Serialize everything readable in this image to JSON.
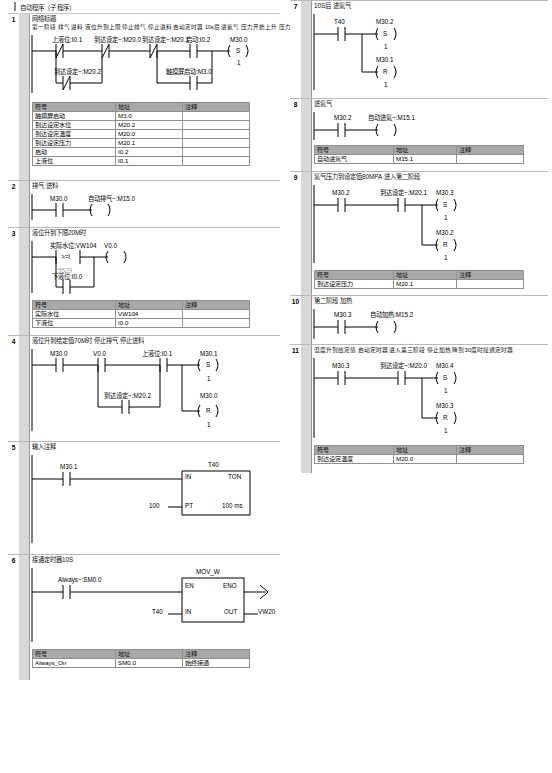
{
  "window": {
    "title": "自动程序（子程序）"
  },
  "table_headers": {
    "symbol": "符号",
    "address": "地址",
    "comment": "注释"
  },
  "networks": [
    {
      "num": "1",
      "title": "网络标题",
      "comment": "第一阶段 排气 进料 液位升到上限 停止排气 停止进料 启动定时器 10s后 进氮气 压力开始上升 压力升到给定值停止进氮气",
      "contacts": {
        "c1": "上液位:I0.1",
        "c2": "到达设定~:M20.0",
        "c3": "到达设定~:M20.1",
        "c4": "启动:I0.2",
        "c5": "触摸屏启动:M3.0",
        "c6": "到达设定~:M20.2"
      },
      "coil": {
        "addr": "M30.0",
        "op": "S",
        "n": "1"
      },
      "symbols": [
        {
          "symbol": "触摸屏启动",
          "address": "M3.0",
          "comment": ""
        },
        {
          "symbol": "到达设定水位",
          "address": "M20.2",
          "comment": ""
        },
        {
          "symbol": "到达设定温度",
          "address": "M20.0",
          "comment": ""
        },
        {
          "symbol": "到达设定压力",
          "address": "M20.1",
          "comment": ""
        },
        {
          "symbol": "启动",
          "address": "I0.2",
          "comment": ""
        },
        {
          "symbol": "上液位",
          "address": "I0.1",
          "comment": ""
        }
      ]
    },
    {
      "num": "2",
      "title": "排气 进料",
      "contacts": {
        "c1": "M30.0"
      },
      "coil": {
        "addr": "自动排气~:M15.0"
      }
    },
    {
      "num": "3",
      "title": "液位升到下限20M时",
      "contacts": {
        "c1": "实际水位:VW104",
        "op": ">=I",
        "val": "5529",
        "c2": "下液位:I0.0"
      },
      "coil": {
        "addr": "V0.0"
      },
      "symbols": [
        {
          "symbol": "实际水位",
          "address": "VW104",
          "comment": ""
        },
        {
          "symbol": "下液位",
          "address": "I0.0",
          "comment": ""
        }
      ]
    },
    {
      "num": "4",
      "title": "液位升到给定值70M时 停止排气 停止进料",
      "contacts": {
        "c1": "M30.0",
        "c2": "V0.0",
        "c3": "上液位:I0.1",
        "c4": "到达设定~:M20.2"
      },
      "coil1": {
        "addr": "M30.1",
        "op": "S",
        "n": "1"
      },
      "coil2": {
        "addr": "M30.0",
        "op": "R",
        "n": "1"
      }
    },
    {
      "num": "5",
      "title": "输入注释",
      "contacts": {
        "c1": "M30.1"
      },
      "box": {
        "name": "T40",
        "type": "TON",
        "in": "IN",
        "eno": "",
        "pt": "PT",
        "pt_val": "100",
        "base": "100 ms"
      }
    },
    {
      "num": "6",
      "title": "接通定时器10S",
      "contacts": {
        "c1": "Always~:SM0.0"
      },
      "box": {
        "name": "MOV_W",
        "en": "EN",
        "eno": "ENO",
        "in": "IN",
        "in_val": "T40",
        "out": "OUT",
        "out_val": "VW20"
      },
      "symbols": [
        {
          "symbol": "Always_On",
          "address": "SM0.0",
          "comment": "始终接通"
        }
      ]
    },
    {
      "num": "7",
      "title": "10S后 进氮气",
      "contacts": {
        "c1": "T40"
      },
      "coil1": {
        "addr": "M30.2",
        "op": "S",
        "n": "1"
      },
      "coil2": {
        "addr": "M30.1",
        "op": "R",
        "n": "1"
      }
    },
    {
      "num": "8",
      "title": "进氮气",
      "contacts": {
        "c1": "M30.2"
      },
      "coil": {
        "addr": "自动进氮~:M15.1"
      },
      "symbols": [
        {
          "symbol": "自动进氮气",
          "address": "M15.1",
          "comment": ""
        }
      ]
    },
    {
      "num": "9",
      "title": "氮气压力到设定值80MPA 进入第二阶段",
      "contacts": {
        "c1": "M30.2",
        "c2": "到达设定~:M20.1"
      },
      "coil1": {
        "addr": "M30.3",
        "op": "S",
        "n": "1"
      },
      "coil2": {
        "addr": "M30.2",
        "op": "R",
        "n": "1"
      },
      "symbols": [
        {
          "symbol": "到达设定压力",
          "address": "M20.1",
          "comment": ""
        }
      ]
    },
    {
      "num": "10",
      "title": "第二阶段 加热",
      "contacts": {
        "c1": "M30.3"
      },
      "coil": {
        "addr": "自动加热:M15.2"
      }
    },
    {
      "num": "11",
      "title": "温度升到给定值 启动定时器 进入第三阶段 停止加热 降到30度时接通定时器",
      "contacts": {
        "c1": "M30.3",
        "c2": "到达设定~:M20.0"
      },
      "coil1": {
        "addr": "M30.4",
        "op": "S",
        "n": "1"
      },
      "coil2": {
        "addr": "M30.3",
        "op": "R",
        "n": "1"
      },
      "symbols": [
        {
          "symbol": "到达设定温度",
          "address": "M20.0",
          "comment": ""
        }
      ]
    }
  ]
}
